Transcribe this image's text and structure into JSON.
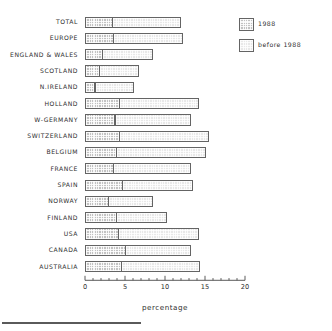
{
  "chart_data": {
    "type": "bar",
    "orientation": "horizontal",
    "stacked": true,
    "title": "",
    "xlabel": "percentage",
    "ylabel": "",
    "xlim": [
      0,
      20
    ],
    "xticks": [
      0,
      5,
      10,
      15,
      20
    ],
    "xtick_labels": [
      "0",
      "5",
      "10",
      "15",
      "20"
    ],
    "minor_ticks_per_interval": 4,
    "grid": false,
    "legend_position": "top-right",
    "categories": [
      "TOTAL",
      "EUROPE",
      "ENGLAND & WALES",
      "SCOTLAND",
      "N.IRELAND",
      "HOLLAND",
      "W-GERMANY",
      "SWITZERLAND",
      "BELGIUM",
      "FRANCE",
      "SPAIN",
      "NORWAY",
      "FINLAND",
      "USA",
      "CANADA",
      "AUSTRALIA"
    ],
    "series": [
      {
        "name": "1988",
        "color": "#c2c2c2",
        "values": [
          3.5,
          3.6,
          2.2,
          1.9,
          1.3,
          4.4,
          3.8,
          4.4,
          4.0,
          3.6,
          4.7,
          3.0,
          4.0,
          4.2,
          5.1,
          4.6
        ]
      },
      {
        "name": "before 1988",
        "color": "#e8e8e8",
        "values": [
          8.6,
          8.7,
          6.4,
          4.9,
          4.9,
          10.0,
          9.6,
          11.2,
          11.2,
          9.8,
          8.9,
          5.6,
          6.4,
          10.1,
          8.3,
          9.9
        ]
      }
    ],
    "totals": [
      12.1,
      12.3,
      8.6,
      6.8,
      6.2,
      14.4,
      13.4,
      15.6,
      15.2,
      13.4,
      13.6,
      8.6,
      10.4,
      14.3,
      13.4,
      14.5
    ]
  },
  "legend": {
    "items": [
      {
        "label": "1988",
        "swatch": "recent"
      },
      {
        "label": "before 1988",
        "swatch": "older"
      }
    ]
  },
  "axis": {
    "xlabel": "percentage"
  }
}
